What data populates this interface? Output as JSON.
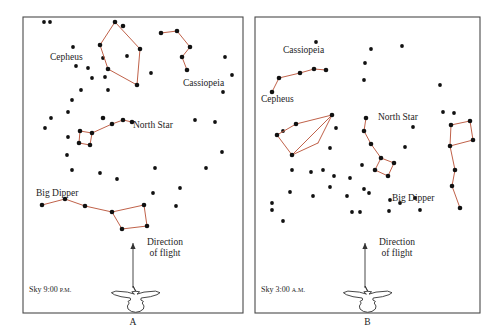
{
  "figure": {
    "line_color": "#c0624a",
    "star_color": "#111111",
    "frame_color": "#4a4a4a",
    "background": "#ffffff"
  },
  "panels": [
    {
      "id": "A",
      "caption": "A",
      "sky_time_label": "Sky 9:00 ",
      "sky_time_ampm": "P.M.",
      "direction_label_line1": "Direction",
      "direction_label_line2": "of flight",
      "frame": {
        "x": 23,
        "y": 17,
        "w": 220,
        "h": 296
      },
      "constellation_labels": [
        {
          "name": "Cepheus",
          "text": "Cepheus",
          "x": 50,
          "y": 52
        },
        {
          "name": "Cassiopeia",
          "text": "Cassiopeia",
          "x": 183,
          "y": 78
        },
        {
          "name": "North Star",
          "text": "North Star",
          "x": 133,
          "y": 120
        },
        {
          "name": "Big Dipper",
          "text": "Big Dipper",
          "x": 36,
          "y": 188
        }
      ],
      "constellations": [
        {
          "name": "cepheus",
          "stars": [
            [
              115,
              22
            ],
            [
              123,
              26
            ],
            [
              100,
              45
            ],
            [
              140,
              49
            ],
            [
              108,
              69
            ],
            [
              137,
              85
            ]
          ],
          "segments": [
            [
              [
                115,
                22
              ],
              [
                100,
                45
              ]
            ],
            [
              [
                115,
                22
              ],
              [
                140,
                49
              ]
            ],
            [
              [
                100,
                45
              ],
              [
                108,
                69
              ]
            ],
            [
              [
                108,
                69
              ],
              [
                137,
                85
              ]
            ],
            [
              [
                140,
                49
              ],
              [
                137,
                85
              ]
            ]
          ]
        },
        {
          "name": "cassiopeia",
          "stars": [
            [
              161,
              33
            ],
            [
              177,
              31
            ],
            [
              190,
              47
            ],
            [
              182,
              57
            ],
            [
              187,
              70
            ]
          ],
          "segments": [
            [
              [
                161,
                33
              ],
              [
                177,
                31
              ]
            ],
            [
              [
                177,
                31
              ],
              [
                190,
                47
              ]
            ],
            [
              [
                190,
                47
              ],
              [
                182,
                57
              ]
            ],
            [
              [
                182,
                57
              ],
              [
                187,
                70
              ]
            ]
          ]
        },
        {
          "name": "little-dipper-north-star",
          "stars": [
            [
              103,
              118
            ],
            [
              123,
              120
            ],
            [
              132,
              122
            ],
            [
              112,
              124
            ],
            [
              92,
              133
            ],
            [
              80,
              131
            ],
            [
              79,
              143
            ],
            [
              90,
              145
            ]
          ],
          "segments": [
            [
              [
                132,
                122
              ],
              [
                123,
                120
              ]
            ],
            [
              [
                123,
                120
              ],
              [
                112,
                124
              ]
            ],
            [
              [
                112,
                124
              ],
              [
                92,
                133
              ]
            ],
            [
              [
                92,
                133
              ],
              [
                80,
                131
              ]
            ],
            [
              [
                80,
                131
              ],
              [
                79,
                143
              ]
            ],
            [
              [
                79,
                143
              ],
              [
                90,
                145
              ]
            ],
            [
              [
                90,
                145
              ],
              [
                92,
                133
              ]
            ]
          ]
        },
        {
          "name": "big-dipper",
          "stars": [
            [
              42,
              205
            ],
            [
              65,
              199
            ],
            [
              85,
              206
            ],
            [
              112,
              212
            ],
            [
              122,
              229
            ],
            [
              147,
              226
            ],
            [
              144,
              205
            ]
          ],
          "segments": [
            [
              [
                42,
                205
              ],
              [
                65,
                199
              ]
            ],
            [
              [
                65,
                199
              ],
              [
                85,
                206
              ]
            ],
            [
              [
                85,
                206
              ],
              [
                112,
                212
              ]
            ],
            [
              [
                112,
                212
              ],
              [
                122,
                229
              ]
            ],
            [
              [
                122,
                229
              ],
              [
                147,
                226
              ]
            ],
            [
              [
                147,
                226
              ],
              [
                144,
                205
              ]
            ],
            [
              [
                144,
                205
              ],
              [
                112,
                212
              ]
            ]
          ]
        }
      ],
      "field_stars": [
        [
          44,
          22
        ],
        [
          50,
          22
        ],
        [
          73,
          47
        ],
        [
          103,
          58
        ],
        [
          127,
          56
        ],
        [
          151,
          73
        ],
        [
          76,
          66
        ],
        [
          88,
          68
        ],
        [
          92,
          78
        ],
        [
          105,
          77
        ],
        [
          108,
          90
        ],
        [
          81,
          90
        ],
        [
          72,
          100
        ],
        [
          68,
          112
        ],
        [
          51,
          118
        ],
        [
          45,
          128
        ],
        [
          68,
          137
        ],
        [
          67,
          155
        ],
        [
          72,
          170
        ],
        [
          100,
          173
        ],
        [
          117,
          179
        ],
        [
          225,
          57
        ],
        [
          232,
          75
        ],
        [
          223,
          92
        ],
        [
          195,
          120
        ],
        [
          215,
          122
        ],
        [
          222,
          152
        ],
        [
          206,
          168
        ],
        [
          180,
          188
        ],
        [
          176,
          206
        ],
        [
          155,
          168
        ],
        [
          153,
          193
        ]
      ],
      "arrow": {
        "x": 133,
        "y_top": 243,
        "y_bottom": 288
      },
      "bird": {
        "cx": 133,
        "cy": 297
      }
    },
    {
      "id": "B",
      "caption": "B",
      "sky_time_label": "Sky 3:00 ",
      "sky_time_ampm": "A.M.",
      "direction_label_line1": "Direction",
      "direction_label_line2": "of flight",
      "frame": {
        "x": 255,
        "y": 17,
        "w": 225,
        "h": 296
      },
      "constellation_labels": [
        {
          "name": "Cassiopeia",
          "text": "Cassiopeia",
          "x": 283,
          "y": 45
        },
        {
          "name": "Cepheus",
          "text": "Cepheus",
          "x": 261,
          "y": 94
        },
        {
          "name": "North Star",
          "text": "North Star",
          "x": 378,
          "y": 112
        },
        {
          "name": "Big Dipper",
          "text": "Big Dipper",
          "x": 392,
          "y": 193
        }
      ],
      "constellations": [
        {
          "name": "cassiopeia",
          "stars": [
            [
              300,
              73
            ],
            [
              314,
              69
            ],
            [
              326,
              70
            ],
            [
              279,
              78
            ],
            [
              272,
              92
            ]
          ],
          "segments": [
            [
              [
                326,
                70
              ],
              [
                314,
                69
              ]
            ],
            [
              [
                314,
                69
              ],
              [
                300,
                73
              ]
            ],
            [
              [
                300,
                73
              ],
              [
                279,
                78
              ]
            ],
            [
              [
                279,
                78
              ],
              [
                272,
                92
              ]
            ]
          ]
        },
        {
          "name": "cepheus",
          "stars": [
            [
              332,
              115
            ],
            [
              296,
              124
            ],
            [
              277,
              135
            ],
            [
              292,
              155
            ]
          ],
          "segments": [
            [
              [
                332,
                115
              ],
              [
                296,
                124
              ]
            ],
            [
              [
                296,
                124
              ],
              [
                277,
                135
              ]
            ],
            [
              [
                277,
                135
              ],
              [
                292,
                155
              ]
            ],
            [
              [
                292,
                155
              ],
              [
                332,
                115
              ]
            ],
            [
              [
                292,
                155
              ],
              [
                318,
                143
              ]
            ],
            [
              [
                318,
                143
              ],
              [
                332,
                115
              ]
            ]
          ]
        },
        {
          "name": "little-dipper-north-star",
          "stars": [
            [
              366,
              118
            ],
            [
              364,
              131
            ],
            [
              371,
              144
            ],
            [
              381,
              158
            ],
            [
              375,
              170
            ],
            [
              388,
              176
            ],
            [
              394,
              163
            ]
          ],
          "segments": [
            [
              [
                366,
                118
              ],
              [
                364,
                131
              ]
            ],
            [
              [
                364,
                131
              ],
              [
                371,
                144
              ]
            ],
            [
              [
                371,
                144
              ],
              [
                381,
                158
              ]
            ],
            [
              [
                381,
                158
              ],
              [
                375,
                170
              ]
            ],
            [
              [
                375,
                170
              ],
              [
                388,
                176
              ]
            ],
            [
              [
                388,
                176
              ],
              [
                394,
                163
              ]
            ],
            [
              [
                394,
                163
              ],
              [
                381,
                158
              ]
            ]
          ]
        },
        {
          "name": "big-dipper",
          "stars": [
            [
              451,
              125
            ],
            [
              470,
              121
            ],
            [
              473,
              140
            ],
            [
              450,
              146
            ],
            [
              455,
              170
            ],
            [
              452,
              186
            ],
            [
              460,
              208
            ]
          ],
          "segments": [
            [
              [
                451,
                125
              ],
              [
                470,
                121
              ]
            ],
            [
              [
                470,
                121
              ],
              [
                473,
                140
              ]
            ],
            [
              [
                473,
                140
              ],
              [
                450,
                146
              ]
            ],
            [
              [
                450,
                146
              ],
              [
                451,
                125
              ]
            ],
            [
              [
                450,
                146
              ],
              [
                455,
                170
              ]
            ],
            [
              [
                455,
                170
              ],
              [
                452,
                186
              ]
            ],
            [
              [
                452,
                186
              ],
              [
                460,
                208
              ]
            ]
          ]
        }
      ],
      "field_stars": [
        [
          316,
          42
        ],
        [
          371,
          49
        ],
        [
          402,
          46
        ],
        [
          365,
          63
        ],
        [
          364,
          80
        ],
        [
          440,
          85
        ],
        [
          443,
          112
        ],
        [
          454,
          113
        ],
        [
          336,
          128
        ],
        [
          283,
          131
        ],
        [
          330,
          148
        ],
        [
          405,
          147
        ],
        [
          413,
          127
        ],
        [
          292,
          170
        ],
        [
          311,
          172
        ],
        [
          323,
          170
        ],
        [
          334,
          176
        ],
        [
          330,
          187
        ],
        [
          350,
          178
        ],
        [
          362,
          165
        ],
        [
          364,
          189
        ],
        [
          369,
          193
        ],
        [
          313,
          196
        ],
        [
          272,
          203
        ],
        [
          272,
          210
        ],
        [
          283,
          221
        ],
        [
          347,
          196
        ],
        [
          390,
          200
        ],
        [
          400,
          203
        ],
        [
          415,
          198
        ],
        [
          420,
          210
        ],
        [
          352,
          212
        ],
        [
          360,
          212
        ],
        [
          389,
          211
        ],
        [
          290,
          192
        ]
      ],
      "arrow": {
        "x": 365,
        "y_top": 243,
        "y_bottom": 288
      },
      "bird": {
        "cx": 365,
        "cy": 297
      }
    }
  ]
}
